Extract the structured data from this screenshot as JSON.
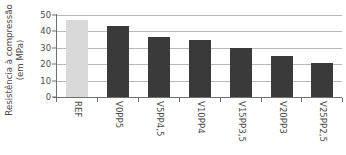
{
  "chart_data": {
    "type": "bar",
    "title": "",
    "xlabel": "",
    "ylabel": "Resistência à compressão (em MPa)",
    "ylabel_lines": [
      "Resistência à compressão",
      "(em MPa)"
    ],
    "categories": [
      "REF",
      "V0PP5",
      "V5PP4,5",
      "V10PP4",
      "V15PP3,5",
      "V20PP3",
      "V25PP2,5"
    ],
    "values": [
      47,
      43,
      36.5,
      35,
      30,
      25,
      20.5
    ],
    "ylim": [
      0,
      50
    ],
    "yticks": [
      50,
      40,
      30,
      20,
      10,
      0
    ],
    "ytick_labels": [
      "50",
      "40",
      "30",
      "20",
      "10",
      "0"
    ],
    "grid": "horizontal",
    "legend": "none",
    "bar_colors": [
      "#d9d9d9",
      "#3a3a3a",
      "#3a3a3a",
      "#3a3a3a",
      "#3a3a3a",
      "#3a3a3a",
      "#3a3a3a"
    ],
    "colors": {
      "reference_bar": "#d9d9d9",
      "series_bar": "#3a3a3a",
      "gridline": "#b8b8b8",
      "axis": "#6f6f6f",
      "text": "#4a4a4a",
      "background": "#ffffff"
    }
  }
}
